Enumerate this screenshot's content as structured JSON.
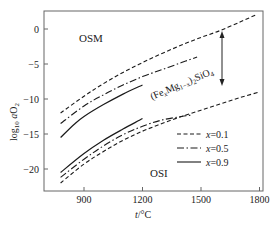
{
  "chart_data": {
    "type": "line",
    "title": "",
    "xlabel": "t/°C",
    "ylabel": "log10 aO2",
    "xlim": [
      720,
      1830
    ],
    "ylim": [
      -23,
      2.6
    ],
    "xticks": [
      900,
      1200,
      1500,
      1800
    ],
    "yticks": [
      0,
      -5,
      -10,
      -15,
      -20
    ],
    "grid": false,
    "legend_position": "lower right",
    "annotations": [
      {
        "text": "OSM",
        "x": 830,
        "y": -1
      },
      {
        "text": "OSI",
        "x": 1240,
        "y": -21
      },
      {
        "text": "(FexMg1-x)2SiO4",
        "x": 1310,
        "y": -9,
        "rotation": -22
      },
      {
        "text": "double-headed arrow",
        "x": 1600,
        "y_from": -1,
        "y_to": -8
      }
    ],
    "series": [
      {
        "name": "x=0.1",
        "group": "upper",
        "style": "dashed",
        "x": [
          780,
          900,
          1000,
          1100,
          1200,
          1300,
          1400,
          1500,
          1600,
          1700,
          1780
        ],
        "values": [
          -12.0,
          -9.6,
          -7.8,
          -6.2,
          -4.8,
          -3.5,
          -2.3,
          -1.2,
          -0.2,
          1.0,
          2.0
        ]
      },
      {
        "name": "x=0.5",
        "group": "upper",
        "style": "dashdot",
        "x": [
          780,
          900,
          1000,
          1100,
          1200,
          1300,
          1400,
          1480
        ],
        "values": [
          -13.5,
          -11.0,
          -9.4,
          -8.0,
          -6.8,
          -5.8,
          -4.8,
          -4.0
        ]
      },
      {
        "name": "x=0.9",
        "group": "upper",
        "style": "solid",
        "x": [
          780,
          850,
          900,
          1000,
          1100,
          1200
        ],
        "values": [
          -15.5,
          -13.6,
          -12.5,
          -10.8,
          -9.3,
          -8.0
        ]
      },
      {
        "name": "x=0.1",
        "group": "lower",
        "style": "dashed",
        "x": [
          780,
          900,
          1000,
          1100,
          1200,
          1300,
          1400,
          1500,
          1600,
          1700,
          1800
        ],
        "values": [
          -22.0,
          -19.3,
          -17.5,
          -15.9,
          -14.6,
          -13.5,
          -12.5,
          -11.6,
          -10.7,
          -9.8,
          -9.0
        ]
      },
      {
        "name": "x=0.5",
        "group": "lower",
        "style": "dashdot",
        "x": [
          780,
          900,
          1000,
          1100,
          1200,
          1300,
          1400,
          1450
        ],
        "values": [
          -21.2,
          -18.6,
          -16.7,
          -15.1,
          -13.9,
          -13.0,
          -12.5,
          -12.3
        ]
      },
      {
        "name": "x=0.9",
        "group": "lower",
        "style": "solid",
        "x": [
          780,
          900,
          1000,
          1100,
          1200
        ],
        "values": [
          -20.5,
          -17.8,
          -15.9,
          -14.3,
          -12.8
        ]
      }
    ],
    "legend": [
      {
        "label": "x=0.1",
        "style": "dashed"
      },
      {
        "label": "x=0.5",
        "style": "dashdot"
      },
      {
        "label": "x=0.9",
        "style": "solid"
      }
    ]
  },
  "labels": {
    "osm": "OSM",
    "osi": "OSI",
    "mineral_prefix": "(Fe",
    "mineral_x": "x",
    "mineral_mg": "Mg",
    "mineral_1x": "1−x",
    "mineral_close": ")",
    "mineral_2": "2",
    "mineral_sio": "SiO",
    "mineral_4": "4",
    "xlabel_t": "t",
    "xlabel_unit": "/°C",
    "ylabel_log": "log",
    "ylabel_10": "10",
    "ylabel_a": "a",
    "ylabel_o": "O",
    "ylabel_2": "2",
    "legend_x": "x",
    "legend_vals": [
      "=0.1",
      "=0.5",
      "=0.9"
    ],
    "xtick_labels": [
      "900",
      "1200",
      "1500",
      "1800"
    ],
    "ytick_labels": [
      "0",
      "−5",
      "−10",
      "−15",
      "−20"
    ]
  },
  "colors": {
    "axis": "#555555",
    "line": "#1a1a1a",
    "background": "#ffffff"
  }
}
